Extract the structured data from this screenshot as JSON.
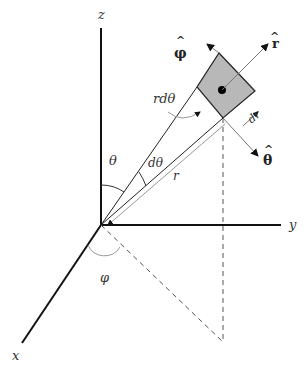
{
  "diagram": {
    "axes": {
      "z": "z",
      "y": "y",
      "x": "x"
    },
    "angles": {
      "theta": "θ",
      "dtheta": "dθ",
      "phi": "φ"
    },
    "lengths": {
      "r": "r",
      "rdtheta": "rdθ",
      "dr": "dr"
    },
    "unit_vectors": {
      "r_hat": "r",
      "theta_hat": "θ",
      "phi_hat": "φ",
      "hat_mark": "^"
    },
    "colors": {
      "element_fill": "#b8b8b8",
      "axis": "#111111",
      "guide": "#555555"
    }
  }
}
